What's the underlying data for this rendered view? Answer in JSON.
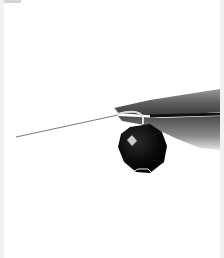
{
  "image": {
    "subject": "black faceted bead on head pin held by pliers",
    "background_color": "#ffffff",
    "bead_color": "#0d0d0d",
    "pliers_color": "#5a5a5a",
    "wire_color": "#8a8a8a"
  }
}
